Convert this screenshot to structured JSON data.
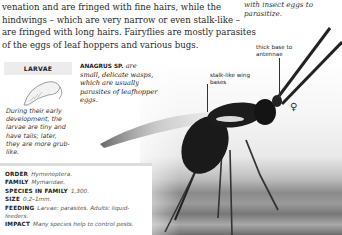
{
  "intro_text": "venation and are fringed with fine hairs, while the hindwings – which are very narrow or even stalk-like – are fringed with long hairs. Fairyflies are mostly parasites of the eggs of leaf hoppers and various bugs.",
  "top_right_caption": "with insect eggs to parasitize.",
  "larvae": {
    "heading": "LARVAE",
    "text": "During their early development, the larvae are tiny and have tails; later, they are more grub-like."
  },
  "anagrus": {
    "name": "ANAGRUS SP.",
    "text": "are small, delicate wasps, which are usually parasites of leafhopper eggs."
  },
  "labels": {
    "antennae": "thick base to antennae",
    "wings": "stalk-like wing bases",
    "sex_symbol": "♀"
  },
  "facts": [
    {
      "key": "ORDER",
      "value": "Hymenoptera."
    },
    {
      "key": "FAMILY",
      "value": "Mymaridae."
    },
    {
      "key": "SPECIES IN FAMILY",
      "value": "1,300."
    },
    {
      "key": "SIZE",
      "value": "0.2–1mm."
    },
    {
      "key": "FEEDING",
      "value": "Larvae: parasites. Adults: liquid-feeders."
    },
    {
      "key": "IMPACT",
      "value": "Many species help to control pests."
    }
  ]
}
